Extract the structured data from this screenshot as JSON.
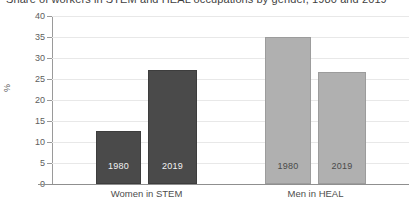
{
  "chart_data": {
    "type": "bar",
    "title": "Share of workers in STEM and HEAL occupations by gender, 1980 and 2019",
    "xlabel": "",
    "ylabel": "%",
    "ylim": [
      0,
      40
    ],
    "yticks": [
      0,
      5,
      10,
      15,
      20,
      25,
      30,
      35,
      40
    ],
    "ytick_labels": [
      "0",
      "5",
      "10",
      "15",
      "20",
      "25",
      "30",
      "35",
      "40"
    ],
    "grid": true,
    "legend": "none",
    "categories": [
      "Women in STEM",
      "Men in HEAL"
    ],
    "series": [
      {
        "name": "1980",
        "values": [
          12.6,
          35.0
        ]
      },
      {
        "name": "2019",
        "values": [
          27.1,
          26.7
        ]
      }
    ],
    "bars": [
      {
        "group": "Women in STEM",
        "year": "1980",
        "value": 12.6,
        "color": "#4a4a4a",
        "label": "1980"
      },
      {
        "group": "Women in STEM",
        "year": "2019",
        "value": 27.1,
        "color": "#4a4a4a",
        "label": "2019"
      },
      {
        "group": "Men in HEAL",
        "year": "1980",
        "value": 35.0,
        "color": "#b0b0b0",
        "label": "1980"
      },
      {
        "group": "Men in HEAL",
        "year": "2019",
        "value": 26.7,
        "color": "#b0b0b0",
        "label": "2019"
      }
    ],
    "colors": {
      "dark_bar": "#4a4a4a",
      "light_bar": "#b0b0b0",
      "gridline": "#e8e8e8",
      "axis": "#8f8f8f",
      "text": "#4d4d4d",
      "background": "#ffffff"
    }
  }
}
